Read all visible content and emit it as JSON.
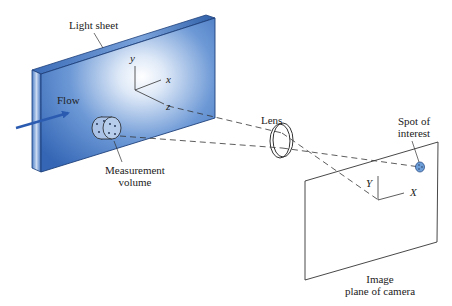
{
  "diagram": {
    "labels": {
      "light_sheet": "Light sheet",
      "flow": "Flow",
      "measurement_volume_line1": "Measurement",
      "measurement_volume_line2": "volume",
      "lens": "Lens",
      "spot_line1": "Spot of",
      "spot_line2": "interest",
      "image_plane_line1": "Image",
      "image_plane_line2": "plane of camera"
    },
    "object_axes": {
      "x": "x",
      "y": "y",
      "z": "z"
    },
    "image_axes": {
      "X": "X",
      "Y": "Y"
    },
    "colors": {
      "sheet_dark": "#2f62b0",
      "sheet_light": "#ffffff",
      "sheet_edge": "#1d3f7a",
      "arrow": "#2a5bb0",
      "line": "#333333",
      "spot": "#6f9fd8"
    },
    "nodes": [
      {
        "id": "light-sheet",
        "label": "Light sheet"
      },
      {
        "id": "measurement-volume",
        "label": "Measurement volume"
      },
      {
        "id": "lens",
        "label": "Lens"
      },
      {
        "id": "image-plane",
        "label": "Image plane of camera"
      },
      {
        "id": "spot",
        "label": "Spot of interest"
      }
    ],
    "edges": [
      {
        "from": "measurement-volume",
        "to": "lens",
        "style": "dashed"
      },
      {
        "from": "lens",
        "to": "spot",
        "style": "dashed"
      }
    ]
  }
}
